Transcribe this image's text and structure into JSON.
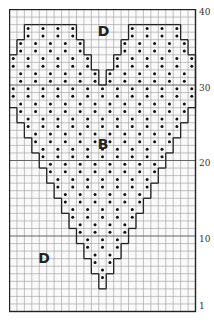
{
  "chart": {
    "title_partial": "",
    "columns": 25,
    "rows": 40,
    "cell_width": 7.44,
    "cell_height": 7.55,
    "grid_color": "#9a9a9a",
    "major_line_color": "#333333",
    "outline_color": "#222222",
    "dot_color": "#111111",
    "row_labels": [
      {
        "text": "40",
        "row": 40
      },
      {
        "text": "30",
        "row": 30
      },
      {
        "text": "20",
        "row": 20
      },
      {
        "text": "10",
        "row": 10
      },
      {
        "text": "1",
        "row": 1
      }
    ],
    "region_labels": [
      {
        "text": "D",
        "col": 12,
        "row": 38
      },
      {
        "text": "B",
        "col": 12,
        "row": 23
      },
      {
        "text": "D",
        "col": 4,
        "row": 8
      }
    ],
    "legend": {
      "B": "contrast color (heart, dotted)",
      "D": "background color"
    },
    "heart_rows": [
      {
        "rows": [
          38,
          37
        ],
        "spans": [
          [
            2,
            8
          ],
          [
            16,
            22
          ]
        ]
      },
      {
        "rows": [
          36,
          35
        ],
        "spans": [
          [
            1,
            9
          ],
          [
            15,
            23
          ]
        ]
      },
      {
        "rows": [
          34,
          33
        ],
        "spans": [
          [
            0,
            10
          ],
          [
            14,
            24
          ]
        ]
      },
      {
        "rows": [
          32,
          31
        ],
        "spans": [
          [
            0,
            11
          ],
          [
            13,
            24
          ]
        ]
      },
      {
        "rows": [
          30,
          29
        ],
        "spans": [
          [
            0,
            24
          ]
        ]
      },
      {
        "rows": [
          28
        ],
        "spans": [
          [
            0,
            24
          ]
        ]
      },
      {
        "rows": [
          27,
          26
        ],
        "spans": [
          [
            1,
            23
          ]
        ]
      },
      {
        "rows": [
          25,
          24
        ],
        "spans": [
          [
            2,
            22
          ]
        ]
      },
      {
        "rows": [
          23,
          22
        ],
        "spans": [
          [
            3,
            21
          ]
        ]
      },
      {
        "rows": [
          21,
          20
        ],
        "spans": [
          [
            4,
            20
          ]
        ]
      },
      {
        "rows": [
          19,
          18
        ],
        "spans": [
          [
            5,
            19
          ]
        ]
      },
      {
        "rows": [
          17,
          16
        ],
        "spans": [
          [
            6,
            18
          ]
        ]
      },
      {
        "rows": [
          15,
          14
        ],
        "spans": [
          [
            7,
            17
          ]
        ]
      },
      {
        "rows": [
          13,
          12
        ],
        "spans": [
          [
            8,
            16
          ]
        ]
      },
      {
        "rows": [
          11,
          10
        ],
        "spans": [
          [
            9,
            15
          ]
        ]
      },
      {
        "rows": [
          9,
          8
        ],
        "spans": [
          [
            10,
            14
          ]
        ]
      },
      {
        "rows": [
          7,
          6
        ],
        "spans": [
          [
            11,
            13
          ]
        ]
      },
      {
        "rows": [
          5,
          4
        ],
        "spans": [
          [
            12,
            12
          ]
        ]
      }
    ]
  }
}
